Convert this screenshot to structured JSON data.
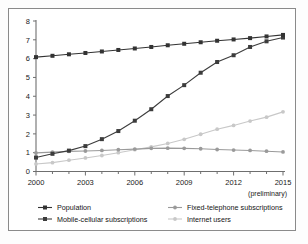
{
  "chart_data": {
    "type": "line",
    "title": "",
    "subtitle": "",
    "xlabel": "",
    "ylabel": "",
    "x": [
      2000,
      2001,
      2002,
      2003,
      2004,
      2005,
      2006,
      2007,
      2008,
      2009,
      2010,
      2011,
      2012,
      2013,
      2014,
      2015
    ],
    "xlim": [
      2000,
      2015
    ],
    "ylim": [
      0,
      8
    ],
    "xticks": [
      2000,
      2003,
      2006,
      2009,
      2012,
      2015
    ],
    "xtick_labels": [
      "2000",
      "2003",
      "2006",
      "2009",
      "2012",
      "2015"
    ],
    "yticks": [
      0,
      1,
      2,
      3,
      4,
      5,
      6,
      7,
      8
    ],
    "ytick_labels": [
      "0",
      "1",
      "2",
      "3",
      "4",
      "5",
      "6",
      "7",
      "8"
    ],
    "grid": false,
    "legend_position": "bottom",
    "annotations": [
      "(preliminary)"
    ],
    "series": [
      {
        "name": "Population",
        "color": "#333333",
        "marker": "square",
        "values": [
          6.08,
          6.15,
          6.23,
          6.3,
          6.38,
          6.46,
          6.54,
          6.62,
          6.71,
          6.79,
          6.87,
          6.95,
          7.02,
          7.09,
          7.18,
          7.26
        ]
      },
      {
        "name": "Mobile-cellular subscriptions",
        "color": "#3c3c3c",
        "marker": "square",
        "values": [
          0.74,
          0.94,
          1.11,
          1.35,
          1.72,
          2.15,
          2.7,
          3.31,
          4.01,
          4.59,
          5.25,
          5.82,
          6.18,
          6.62,
          6.92,
          7.12
        ]
      },
      {
        "name": "Fixed-telephone subscriptions",
        "color": "#9a9a9a",
        "marker": "circle",
        "values": [
          0.99,
          1.03,
          1.07,
          1.09,
          1.12,
          1.16,
          1.19,
          1.23,
          1.24,
          1.23,
          1.21,
          1.17,
          1.14,
          1.12,
          1.08,
          1.04
        ]
      },
      {
        "name": "Internet users",
        "color": "#c8c8c8",
        "marker": "circle",
        "values": [
          0.4,
          0.47,
          0.6,
          0.72,
          0.85,
          1.0,
          1.16,
          1.31,
          1.49,
          1.71,
          1.98,
          2.25,
          2.45,
          2.68,
          2.89,
          3.17
        ]
      }
    ]
  },
  "axis": {
    "preliminary_note": "(preliminary)"
  },
  "legend": {
    "entries": [
      {
        "label": "Population",
        "color": "#333333",
        "marker": "square"
      },
      {
        "label": "Fixed-telephone subscriptions",
        "color": "#9a9a9a",
        "marker": "circle"
      },
      {
        "label": "Mobile-cellular subscriptions",
        "color": "#3c3c3c",
        "marker": "square"
      },
      {
        "label": "Internet users",
        "color": "#c8c8c8",
        "marker": "circle"
      }
    ]
  }
}
